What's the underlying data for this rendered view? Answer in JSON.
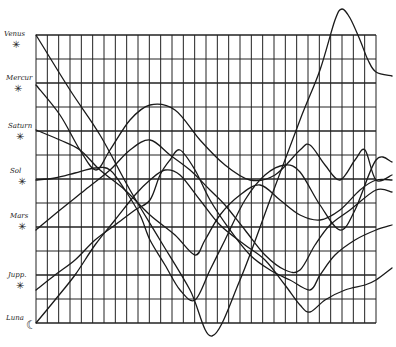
{
  "chart_data": {
    "type": "line",
    "title": "",
    "xlabel": "",
    "ylabel": "",
    "grid": true,
    "grid_columns": 30,
    "grid_rows": 12,
    "legend_position": "left",
    "row_labels": [
      "Venus",
      "Mercur",
      "Saturn",
      "Sol",
      "Mars",
      "Jupiter",
      "Luna"
    ],
    "series": [
      {
        "name": "Venus",
        "points": [
          [
            36,
            35
          ],
          [
            70,
            90
          ],
          [
            100,
            135
          ],
          [
            130,
            190
          ],
          [
            160,
            240
          ],
          [
            190,
            290
          ],
          [
            212,
            336
          ],
          [
            240,
            280
          ],
          [
            270,
            200
          ],
          [
            300,
            120
          ],
          [
            320,
            70
          ],
          [
            335,
            20
          ],
          [
            342,
            9
          ],
          [
            350,
            18
          ],
          [
            360,
            40
          ],
          [
            368,
            60
          ],
          [
            376,
            72
          ],
          [
            392,
            76
          ]
        ]
      },
      {
        "name": "Mercur",
        "points": [
          [
            36,
            85
          ],
          [
            60,
            115
          ],
          [
            80,
            150
          ],
          [
            96,
            170
          ],
          [
            110,
            150
          ],
          [
            130,
            120
          ],
          [
            150,
            105
          ],
          [
            175,
            110
          ],
          [
            200,
            140
          ],
          [
            225,
            165
          ],
          [
            250,
            180
          ],
          [
            275,
            175
          ],
          [
            300,
            150
          ],
          [
            310,
            145
          ],
          [
            325,
            165
          ],
          [
            340,
            180
          ],
          [
            355,
            160
          ],
          [
            365,
            150
          ],
          [
            376,
            180
          ],
          [
            392,
            175
          ]
        ]
      },
      {
        "name": "Saturn",
        "points": [
          [
            36,
            130
          ],
          [
            60,
            140
          ],
          [
            80,
            150
          ],
          [
            100,
            170
          ],
          [
            125,
            190
          ],
          [
            150,
            215
          ],
          [
            175,
            235
          ],
          [
            195,
            255
          ],
          [
            205,
            240
          ],
          [
            220,
            215
          ],
          [
            240,
            195
          ],
          [
            260,
            185
          ],
          [
            280,
            200
          ],
          [
            300,
            215
          ],
          [
            320,
            220
          ],
          [
            340,
            210
          ],
          [
            360,
            190
          ],
          [
            376,
            180
          ],
          [
            392,
            180
          ]
        ]
      },
      {
        "name": "Sol",
        "points": [
          [
            36,
            180
          ],
          [
            55,
            178
          ],
          [
            75,
            173
          ],
          [
            95,
            168
          ],
          [
            110,
            170
          ],
          [
            125,
            190
          ],
          [
            140,
            215
          ],
          [
            150,
            240
          ],
          [
            165,
            265
          ],
          [
            180,
            290
          ],
          [
            195,
            300
          ],
          [
            210,
            270
          ],
          [
            225,
            240
          ],
          [
            245,
            200
          ],
          [
            265,
            175
          ],
          [
            285,
            165
          ],
          [
            300,
            172
          ],
          [
            320,
            205
          ],
          [
            340,
            230
          ],
          [
            355,
            210
          ],
          [
            376,
            160
          ],
          [
            392,
            162
          ]
        ]
      },
      {
        "name": "Mars",
        "points": [
          [
            36,
            230
          ],
          [
            60,
            210
          ],
          [
            85,
            190
          ],
          [
            110,
            170
          ],
          [
            130,
            150
          ],
          [
            150,
            140
          ],
          [
            170,
            155
          ],
          [
            190,
            170
          ],
          [
            210,
            190
          ],
          [
            225,
            205
          ],
          [
            245,
            230
          ],
          [
            265,
            255
          ],
          [
            285,
            270
          ],
          [
            300,
            270
          ],
          [
            315,
            245
          ],
          [
            330,
            225
          ],
          [
            350,
            210
          ],
          [
            376,
            190
          ],
          [
            392,
            192
          ]
        ]
      },
      {
        "name": "Jupiter",
        "points": [
          [
            36,
            290
          ],
          [
            55,
            275
          ],
          [
            75,
            260
          ],
          [
            95,
            240
          ],
          [
            115,
            225
          ],
          [
            135,
            210
          ],
          [
            150,
            200
          ],
          [
            160,
            175
          ],
          [
            170,
            160
          ],
          [
            180,
            150
          ],
          [
            195,
            170
          ],
          [
            210,
            200
          ],
          [
            230,
            230
          ],
          [
            250,
            255
          ],
          [
            270,
            270
          ],
          [
            290,
            280
          ],
          [
            310,
            290
          ],
          [
            320,
            275
          ],
          [
            335,
            255
          ],
          [
            355,
            240
          ],
          [
            376,
            230
          ],
          [
            392,
            225
          ]
        ]
      },
      {
        "name": "Luna",
        "points": [
          [
            36,
            323
          ],
          [
            55,
            300
          ],
          [
            75,
            275
          ],
          [
            95,
            245
          ],
          [
            115,
            220
          ],
          [
            135,
            195
          ],
          [
            150,
            180
          ],
          [
            165,
            170
          ],
          [
            180,
            175
          ],
          [
            200,
            200
          ],
          [
            220,
            225
          ],
          [
            245,
            245
          ],
          [
            265,
            260
          ],
          [
            285,
            285
          ],
          [
            300,
            305
          ],
          [
            310,
            312
          ],
          [
            325,
            300
          ],
          [
            345,
            290
          ],
          [
            365,
            285
          ],
          [
            376,
            280
          ],
          [
            392,
            268
          ]
        ]
      }
    ]
  },
  "labels": [
    {
      "text": "Venus",
      "x": 4,
      "y": 30
    },
    {
      "text": "Mercur",
      "x": 6,
      "y": 74
    },
    {
      "text": "Saturn",
      "x": 8,
      "y": 122
    },
    {
      "text": "Sol",
      "x": 10,
      "y": 167
    },
    {
      "text": "Mars",
      "x": 10,
      "y": 212
    },
    {
      "text": "Jupp.",
      "x": 8,
      "y": 271
    },
    {
      "text": "Luna",
      "x": 6,
      "y": 314
    }
  ],
  "colors": {
    "ink": "#1a1a1a",
    "paper": "#ffffff",
    "grid": "#222222"
  }
}
